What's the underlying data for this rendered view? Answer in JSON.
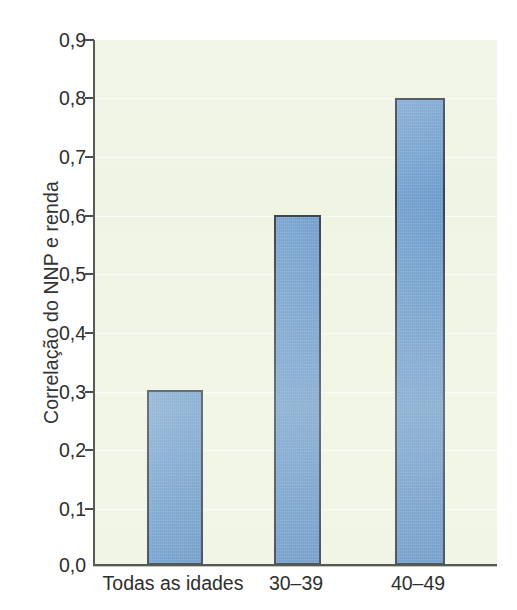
{
  "chart_data": {
    "type": "bar",
    "title": "",
    "subtitle": "",
    "xlabel": "",
    "ylabel": "Correlação do NNP e renda",
    "categories": [
      "Todas as idades",
      "30–39",
      "40–49"
    ],
    "values": [
      0.3,
      0.6,
      0.8
    ],
    "series": [
      {
        "name": "Correlação do NNP e renda",
        "values": [
          0.3,
          0.6,
          0.8
        ]
      }
    ],
    "ylim": [
      0.0,
      0.9
    ],
    "ytick_labels": [
      "0,0",
      "0,1",
      "0,2",
      "0,3",
      "0,4",
      "0,5",
      "0,6",
      "0,7",
      "0,8",
      "0,9"
    ],
    "ytick_values": [
      0.0,
      0.1,
      0.2,
      0.3,
      0.4,
      0.5,
      0.6,
      0.7,
      0.8,
      0.9
    ],
    "grid": true,
    "grid_orientation": "horizontal",
    "legend": null,
    "legend_position": "none",
    "annotations": [],
    "colors": {
      "bar_fill": "#6f9fd0",
      "bar_border": "#3b4350",
      "plot_background": "#eff4e3",
      "axis_line": "#555a55",
      "text": "#2e2e2e",
      "gridline": "#ffffff",
      "page_background": "#ffffff"
    }
  }
}
